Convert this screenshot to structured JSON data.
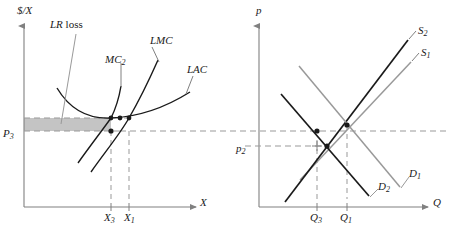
{
  "figure": {
    "type": "economics-diagram",
    "panels": [
      {
        "id": "left",
        "name": "firm-cost-curves",
        "y_axis_label": "$/X",
        "x_axis_label": "X",
        "annotation": "LR loss",
        "annotation_italic_part": "LR",
        "annotation_roman_part": "loss",
        "curve_labels": [
          "MC_2",
          "LMC",
          "LAC"
        ],
        "curves": [
          {
            "name": "LAC",
            "label": "LAC",
            "label_base": "LAC",
            "label_sub": ""
          },
          {
            "name": "LMC",
            "label": "LMC",
            "label_base": "LMC",
            "label_sub": ""
          },
          {
            "name": "MC2",
            "label": "MC2",
            "label_base": "MC",
            "label_sub": "2"
          }
        ],
        "price_tick": {
          "label_base": "P",
          "label_sub": "3",
          "value": "P_3"
        },
        "quantity_ticks": [
          {
            "label_base": "X",
            "label_sub": "3",
            "value": "X_3"
          },
          {
            "label_base": "X",
            "label_sub": "1",
            "value": "X_1"
          }
        ],
        "shaded_region_name": "LR loss area"
      },
      {
        "id": "right",
        "name": "market-supply-demand",
        "y_axis_label": "p",
        "x_axis_label": "Q",
        "curves": [
          {
            "name": "S2",
            "label_base": "S",
            "label_sub": "2",
            "color": "#1a1a1a"
          },
          {
            "name": "S1",
            "label_base": "S",
            "label_sub": "1",
            "color": "#999999"
          },
          {
            "name": "D1",
            "label_base": "D",
            "label_sub": "1",
            "color": "#999999"
          },
          {
            "name": "D2",
            "label_base": "D",
            "label_sub": "2",
            "color": "#1a1a1a"
          }
        ],
        "price_tick": {
          "label_base": "p",
          "label_sub": "2",
          "value": "p_2"
        },
        "quantity_ticks": [
          {
            "label_base": "Q",
            "label_sub": "3",
            "value": "Q_3"
          },
          {
            "label_base": "Q",
            "label_sub": "1",
            "value": "Q_1"
          }
        ]
      }
    ],
    "colors": {
      "axis": "#808080",
      "dark_curve": "#1a1a1a",
      "light_curve": "#999999",
      "dashed": "#999999",
      "shade_fill": "#c4c4c4",
      "text": "#1a1a1a"
    }
  }
}
